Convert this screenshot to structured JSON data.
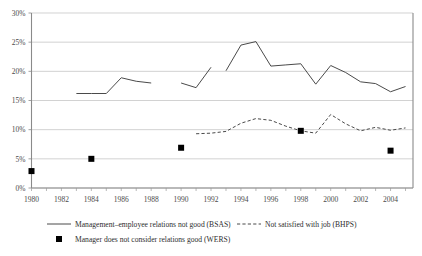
{
  "chart_data": {
    "type": "line",
    "title": "",
    "xlabel": "",
    "ylabel": "",
    "xlim": [
      1980,
      2005.5
    ],
    "ylim": [
      0,
      30
    ],
    "y_tick_labels": [
      "0%",
      "5%",
      "10%",
      "15%",
      "20%",
      "25%",
      "30%"
    ],
    "y_ticks": [
      0,
      5,
      10,
      15,
      20,
      25,
      30
    ],
    "x_tick_labels": [
      "1980",
      "1982",
      "1984",
      "1986",
      "1988",
      "1990",
      "1992",
      "1994",
      "1996",
      "1998",
      "2000",
      "2002",
      "2004"
    ],
    "x_ticks": [
      1980,
      1982,
      1984,
      1986,
      1988,
      1990,
      1992,
      1994,
      1996,
      1998,
      2000,
      2002,
      2004
    ],
    "grid": "horizontal",
    "legend_position": "bottom",
    "series": [
      {
        "name": "Management-employee relations not good (BSAS)",
        "style": "solid",
        "color": "#4a4a4a",
        "segments": [
          [
            [
              1983,
              16.2
            ],
            [
              1984,
              16.2
            ],
            [
              1985,
              16.2
            ],
            [
              1986,
              18.9
            ],
            [
              1987,
              18.3
            ],
            [
              1988,
              18.0
            ]
          ],
          [
            [
              1990,
              18.0
            ],
            [
              1991,
              17.2
            ],
            [
              1992,
              20.7
            ]
          ],
          [
            [
              1993,
              20.1
            ],
            [
              1994,
              24.5
            ],
            [
              1995,
              25.1
            ],
            [
              1996,
              20.9
            ],
            [
              1997,
              21.1
            ],
            [
              1998,
              21.3
            ],
            [
              1999,
              17.8
            ],
            [
              2000,
              21.0
            ],
            [
              2001,
              19.8
            ],
            [
              2002,
              18.2
            ],
            [
              2003,
              17.9
            ],
            [
              2004,
              16.5
            ],
            [
              2005,
              17.4
            ]
          ]
        ]
      },
      {
        "name": "Not satisfied with job (BHPS)",
        "style": "dashed",
        "color": "#4a4a4a",
        "segments": [
          [
            [
              1991,
              9.3
            ],
            [
              1992,
              9.4
            ],
            [
              1993,
              9.7
            ],
            [
              1994,
              11.1
            ],
            [
              1995,
              11.9
            ],
            [
              1996,
              11.6
            ],
            [
              1997,
              10.6
            ],
            [
              1998,
              9.8
            ],
            [
              1999,
              9.4
            ],
            [
              2000,
              12.6
            ],
            [
              2001,
              11.0
            ],
            [
              2002,
              9.8
            ],
            [
              2003,
              10.4
            ],
            [
              2004,
              9.9
            ],
            [
              2005,
              10.3
            ]
          ]
        ]
      },
      {
        "name": "Manager does not consider relations good (WERS)",
        "style": "marker",
        "color": "#000000",
        "points": [
          [
            1980,
            2.9
          ],
          [
            1984,
            5.0
          ],
          [
            1990,
            6.9
          ],
          [
            1998,
            9.8
          ],
          [
            2004,
            6.4
          ]
        ]
      }
    ],
    "legend": [
      {
        "key": "line-solid",
        "label": "Management–employee relations not good (BSAS)"
      },
      {
        "key": "line-dashed",
        "label": "Not satisfied with job (BHPS)"
      },
      {
        "key": "marker-square",
        "label": "Manager does not consider relations good (WERS)"
      }
    ]
  }
}
